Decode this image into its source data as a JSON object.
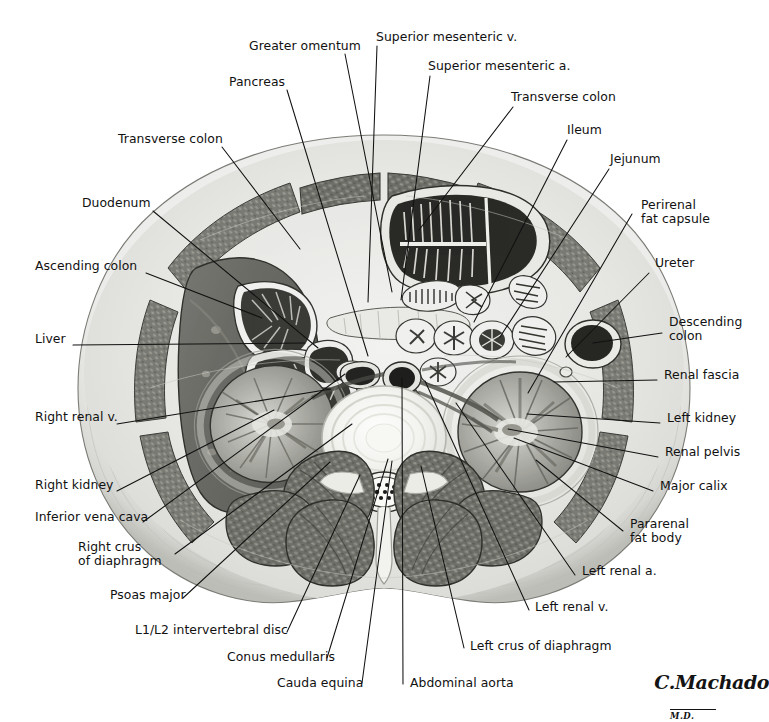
{
  "figure": {
    "kind": "anatomical-cross-section",
    "region": "Abdomen, transverse (axial) section at the L1/L2 intervertebral disc level",
    "background_color": "#ffffff",
    "line_color": "#111111",
    "signature": {
      "name": "C.Machado",
      "credential": "M.D."
    }
  },
  "labels": [
    {
      "id": "greater-omentum",
      "text": "Greater omentum",
      "x": 249,
      "y": 46,
      "align": "left",
      "lx": 345,
      "ly": 54,
      "tx": 392,
      "ty": 292
    },
    {
      "id": "superior-mesenteric-v",
      "text": "Superior mesenteric v.",
      "x": 376,
      "y": 36,
      "align": "left",
      "lx": 377,
      "ly": 46,
      "tx": 368,
      "ty": 302
    },
    {
      "id": "superior-mesenteric-a",
      "text": "Superior mesenteric a.",
      "x": 428,
      "y": 65,
      "align": "left",
      "lx": 430,
      "ly": 76,
      "tx": 401,
      "ty": 300
    },
    {
      "id": "pancreas",
      "text": "Pancreas",
      "x": 229,
      "y": 81,
      "align": "left",
      "lx": 287,
      "ly": 90,
      "tx": 368,
      "ty": 356
    },
    {
      "id": "transverse-colon-right",
      "text": "Transverse colon",
      "x": 511,
      "y": 96,
      "align": "left",
      "lx": 513,
      "ly": 107,
      "tx": 419,
      "ty": 230
    },
    {
      "id": "ileum",
      "text": "Ileum",
      "x": 567,
      "y": 129,
      "align": "left",
      "lx": 567,
      "ly": 140,
      "tx": 474,
      "ty": 322
    },
    {
      "id": "transverse-colon-left",
      "text": "Transverse colon",
      "x": 118,
      "y": 138,
      "align": "left",
      "lx": 222,
      "ly": 147,
      "tx": 300,
      "ty": 249
    },
    {
      "id": "jejunum",
      "text": "Jejunum",
      "x": 610,
      "y": 158,
      "align": "left",
      "lx": 609,
      "ly": 169,
      "tx": 500,
      "ty": 337
    },
    {
      "id": "duodenum",
      "text": "Duodenum",
      "x": 82,
      "y": 202,
      "align": "left",
      "lx": 153,
      "ly": 211,
      "tx": 318,
      "ty": 348
    },
    {
      "id": "perirenal-fat-capsule",
      "text": "Perirenal\nfat capsule",
      "x": 641,
      "y": 204,
      "align": "left",
      "lx": 638,
      "ly": 216,
      "tx": 528,
      "ly2": 0,
      "ty": 393
    },
    {
      "id": "ascending-colon",
      "text": "Ascending colon",
      "x": 35,
      "y": 265,
      "align": "left",
      "lx": 146,
      "ly": 273,
      "tx": 262,
      "ty": 318
    },
    {
      "id": "ureter",
      "text": "Ureter",
      "x": 655,
      "y": 262,
      "align": "left",
      "lx": 653,
      "ly": 273,
      "tx": 566,
      "ty": 357
    },
    {
      "id": "descending-colon",
      "text": "Descending\ncolon",
      "x": 669,
      "y": 321,
      "align": "left",
      "lx": 666,
      "ly": 333,
      "tx": 593,
      "ty": 343
    },
    {
      "id": "liver",
      "text": "Liver",
      "x": 35,
      "y": 338,
      "align": "left",
      "lx": 73,
      "ly": 345,
      "tx": 305,
      "ty": 343
    },
    {
      "id": "renal-fascia",
      "text": "Renal fascia",
      "x": 664,
      "y": 374,
      "align": "left",
      "lx": 661,
      "ly": 382,
      "tx": 554,
      "ty": 382
    },
    {
      "id": "right-renal-v",
      "text": "Right renal v.",
      "x": 35,
      "y": 416,
      "align": "left",
      "lx": 117,
      "ly": 424,
      "tx": 331,
      "ly3": 0,
      "ty": 389
    },
    {
      "id": "left-kidney",
      "text": "Left kidney",
      "x": 667,
      "y": 417,
      "align": "left",
      "lx": 664,
      "ly": 425,
      "tx": 527,
      "ty": 414
    },
    {
      "id": "renal-pelvis",
      "text": "Renal pelvis",
      "x": 665,
      "y": 451,
      "align": "left",
      "lx": 662,
      "ly": 459,
      "tx": 508,
      "ty": 429
    },
    {
      "id": "right-kidney",
      "text": "Right kidney",
      "x": 35,
      "y": 484,
      "align": "left",
      "lx": 117,
      "ly": 491,
      "tx": 274,
      "ty": 410
    },
    {
      "id": "major-calix",
      "text": "Major calix",
      "x": 660,
      "y": 485,
      "align": "left",
      "lx": 657,
      "ly": 493,
      "tx": 514,
      "ty": 438
    },
    {
      "id": "inferior-vena-cava",
      "text": "Inferior vena cava",
      "x": 35,
      "y": 516,
      "align": "left",
      "lx": 143,
      "ly": 524,
      "tx": 345,
      "ty": 374
    },
    {
      "id": "pararenal-fat-body",
      "text": "Pararenal\nfat body",
      "x": 630,
      "y": 523,
      "align": "left",
      "lx": 627,
      "ly": 533,
      "tx": 536,
      "ty": 460
    },
    {
      "id": "right-crus-of-diaphragm",
      "text": "Right crus\nof diaphragm",
      "x": 78,
      "y": 546,
      "align": "left",
      "lx": 175,
      "ly": 556,
      "tx": 352,
      "ty": 424
    },
    {
      "id": "left-renal-a",
      "text": "Left renal a.",
      "x": 582,
      "y": 570,
      "align": "left",
      "lx": 579,
      "ly": 577,
      "tx": 456,
      "ty": 403
    },
    {
      "id": "psoas-major",
      "text": "Psoas major",
      "x": 110,
      "y": 594,
      "align": "left",
      "lx": 183,
      "ly": 600,
      "tx": 330,
      "ty": 462
    },
    {
      "id": "left-renal-v",
      "text": "Left renal v.",
      "x": 535,
      "y": 606,
      "align": "left",
      "lx": 533,
      "ly": 612,
      "tx": 425,
      "ty": 381
    },
    {
      "id": "l1-l2-intervertebral-disc",
      "text": "L1/L2 intervertebral disc",
      "x": 135,
      "y": 629,
      "align": "left",
      "lx": 287,
      "ly": 634,
      "tx": 360,
      "ty": 475
    },
    {
      "id": "left-crus-of-diaphragm",
      "text": "Left crus of diaphragm",
      "x": 470,
      "y": 645,
      "align": "left",
      "lx": 468,
      "ly": 650,
      "tx": 421,
      "ty": 466
    },
    {
      "id": "conus-medullaris",
      "text": "Conus medullaris",
      "x": 227,
      "y": 656,
      "align": "left",
      "lx": 331,
      "ly": 660,
      "tx": 388,
      "ty": 459
    },
    {
      "id": "cauda-equina",
      "text": "Cauda equina",
      "x": 277,
      "y": 682,
      "align": "left",
      "lx": 366,
      "ly": 685,
      "tx": 392,
      "ty": 461
    },
    {
      "id": "abdominal-aorta",
      "text": "Abdominal aorta",
      "x": 410,
      "y": 682,
      "align": "left",
      "lx": 407,
      "ly": 686,
      "tx": 402,
      "ty": 378
    }
  ],
  "structures": [
    {
      "id": "body-wall-skin",
      "name": "Skin and subcutaneous fat"
    },
    {
      "id": "rectus-abdominis",
      "name": "Rectus abdominis muscle"
    },
    {
      "id": "external-oblique",
      "name": "Abdominal oblique muscles"
    },
    {
      "id": "liver-mass",
      "name": "Liver"
    },
    {
      "id": "ascending-colon-lumen",
      "name": "Ascending colon"
    },
    {
      "id": "transverse-colon-lumen",
      "name": "Transverse colon"
    },
    {
      "id": "duodenum-lumen",
      "name": "Duodenum"
    },
    {
      "id": "pancreas-body",
      "name": "Pancreas"
    },
    {
      "id": "jejunum-loops",
      "name": "Jejunal loops"
    },
    {
      "id": "ileum-loops",
      "name": "Ileal loops"
    },
    {
      "id": "descending-colon-lumen",
      "name": "Descending colon"
    },
    {
      "id": "right-kidney-organ",
      "name": "Right kidney"
    },
    {
      "id": "left-kidney-organ",
      "name": "Left kidney"
    },
    {
      "id": "aorta-lumen",
      "name": "Abdominal aorta"
    },
    {
      "id": "ivc-lumen",
      "name": "Inferior vena cava"
    },
    {
      "id": "vertebral-body",
      "name": "L1/L2 intervertebral disc"
    },
    {
      "id": "spinal-canal",
      "name": "Spinal canal with cauda equina"
    },
    {
      "id": "psoas-left",
      "name": "Left psoas major"
    },
    {
      "id": "psoas-right",
      "name": "Right psoas major"
    },
    {
      "id": "erector-spinae-left",
      "name": "Left erector spinae"
    },
    {
      "id": "erector-spinae-right",
      "name": "Right erector spinae"
    }
  ]
}
